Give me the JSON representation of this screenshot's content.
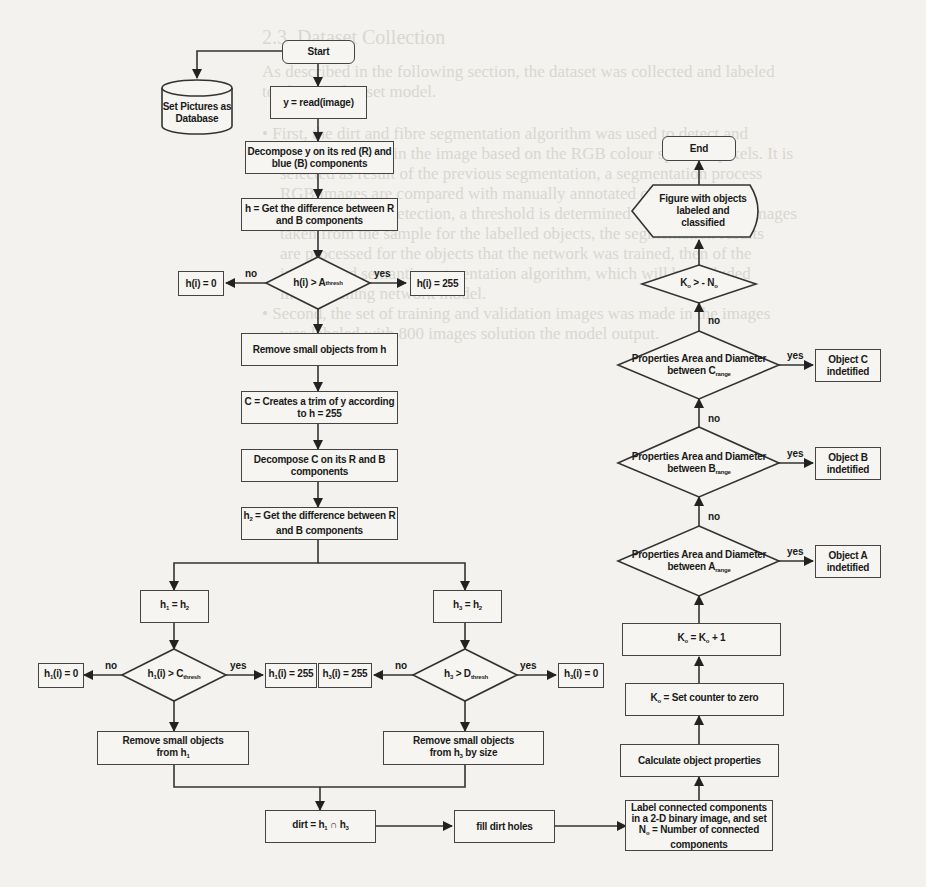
{
  "diagram": {
    "type": "flowchart",
    "nodes": {
      "start": "Start",
      "database": "Set Pictures as Database",
      "read": "y = read(image)",
      "decompose_y": "Decompose y on its red (R) and blue (B) components",
      "h_diff": "h = Get the difference between R and B components",
      "dec_a": {
        "main": "h(i) > A",
        "sub": "thresh"
      },
      "h_zero": "h(i) = 0",
      "h_255": "h(i) = 255",
      "remove_h": "Remove small objects from h",
      "trim": "C = Creates a trim of y according to h = 255",
      "decompose_c": "Decompose C on its R and B components",
      "h2_diff": {
        "pre": "h",
        "sub": "2",
        "post": " = Get the difference between R and B components"
      },
      "h1_assign": {
        "a": "h",
        "a_sub": "1",
        "b": " = h",
        "b_sub": "2"
      },
      "h3_assign": {
        "a": "h",
        "a_sub": "3",
        "b": " = h",
        "b_sub": "2"
      },
      "dec_c": {
        "pre": "h",
        "pre_sub": "1",
        "main": "(i) > C",
        "sub": "thresh"
      },
      "dec_d": {
        "pre": "h",
        "pre_sub": "3",
        "main": " > D",
        "sub": "thresh"
      },
      "h1_zero": {
        "pre": "h",
        "sub": "1",
        "post": "(i) = 0"
      },
      "h1_255": {
        "pre": "h",
        "sub": "1",
        "post": "(i) = 255"
      },
      "h3_255": {
        "pre": "h",
        "sub": "3",
        "post": "(i) = 255"
      },
      "h3_zero": {
        "pre": "h",
        "sub": "3",
        "post": "(i) = 0"
      },
      "remove_h1": {
        "line1": "Remove small objects",
        "pre": "from h",
        "sub": "1"
      },
      "remove_h3": {
        "line1": "Remove small objects",
        "pre": "from h",
        "sub": "3",
        "post": " by size"
      },
      "dirt": {
        "pre": "dirt = h",
        "sub1": "1",
        "mid": " ∩ h",
        "sub2": "3"
      },
      "fill": "fill dirt holes",
      "label_cc": {
        "line1": "Label connected components",
        "line2": "in a 2-D binary image, and set",
        "pre": "N",
        "sub": "o",
        "post": " = Number of connected",
        "line4": "components"
      },
      "calc": "Calculate object properties",
      "k_zero": {
        "pre": "K",
        "sub": "o",
        "post": " = Set counter to zero"
      },
      "k_inc": {
        "pre": "K",
        "sub": "o",
        "mid": " = K",
        "sub2": "o",
        "post": " + 1"
      },
      "dec_a_range": {
        "line1": "Properties Area and Diameter",
        "pre": "between A",
        "sub": "range"
      },
      "dec_b_range": {
        "line1": "Properties Area and Diameter",
        "pre": "between B",
        "sub": "range"
      },
      "dec_c_range": {
        "line1": "Properties Area and Diameter",
        "pre": "between C",
        "sub": "range"
      },
      "obj_a": "Object A indetified",
      "obj_b": "Object B indetified",
      "obj_c": "Object C indetified",
      "dec_k": {
        "pre": "K",
        "sub": "o",
        "mid": " > - N",
        "sub2": "o"
      },
      "display": "Figure with objects labeled and classified",
      "end": "End"
    },
    "edge_labels": {
      "yes": "yes",
      "no": "no"
    }
  }
}
